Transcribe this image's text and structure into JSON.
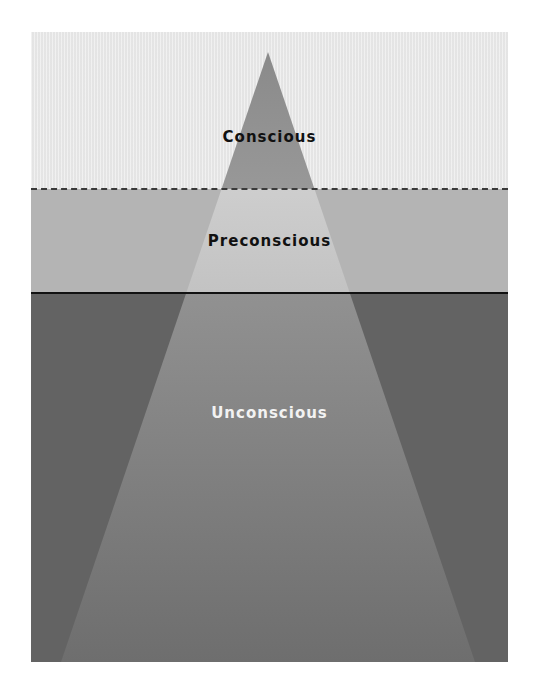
{
  "diagram": {
    "type": "iceberg-model-of-mind",
    "layers": [
      {
        "name": "conscious",
        "label": "Conscious",
        "color": "#e9e9e9",
        "text_color": "#111111"
      },
      {
        "name": "preconscious",
        "label": "Preconscious",
        "color": "#b4b4b4",
        "text_color": "#111111"
      },
      {
        "name": "unconscious",
        "label": "Unconscious",
        "color": "#636363",
        "text_color": "#f2f2f2"
      }
    ],
    "dividers": [
      {
        "between": "conscious-preconscious",
        "style": "dashed"
      },
      {
        "between": "preconscious-unconscious",
        "style": "solid"
      }
    ],
    "triangle": {
      "shape": "gradient-pyramid",
      "color_top": "#8c8c8c",
      "color_bottom": "#7a7a7a"
    }
  }
}
